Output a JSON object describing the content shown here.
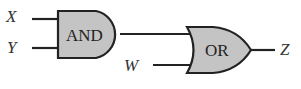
{
  "diagram": {
    "type": "logic-circuit",
    "inputs": [
      {
        "name": "X"
      },
      {
        "name": "Y"
      },
      {
        "name": "W"
      }
    ],
    "gates": [
      {
        "id": "and",
        "label": "AND",
        "inputs": [
          "X",
          "Y"
        ]
      },
      {
        "id": "or",
        "label": "OR",
        "inputs": [
          "AND",
          "W"
        ]
      }
    ],
    "output": {
      "name": "Z"
    },
    "colors": {
      "gate_fill": "#c4c4c4",
      "stroke": "#222222",
      "text": "#333333"
    }
  }
}
